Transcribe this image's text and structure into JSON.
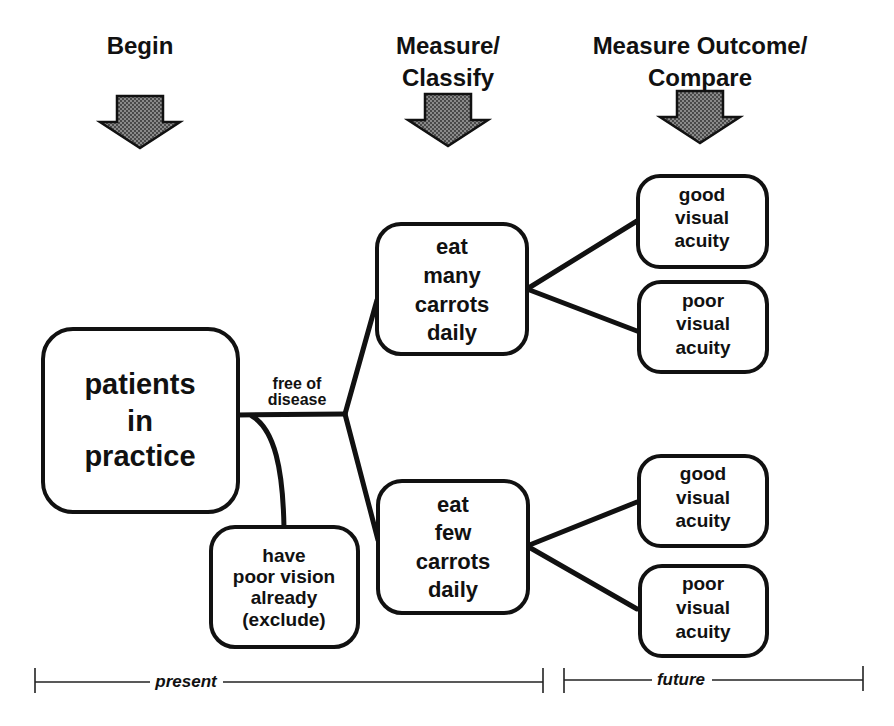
{
  "diagram": {
    "type": "flow",
    "stages": [
      {
        "id": "begin",
        "label_lines": [
          "Begin"
        ]
      },
      {
        "id": "measure_classify",
        "label_lines": [
          "Measure/",
          "Classify"
        ]
      },
      {
        "id": "measure_outcome",
        "label_lines": [
          "Measure Outcome/",
          "Compare"
        ]
      }
    ],
    "nodes": {
      "patients": {
        "lines": [
          "patients",
          "in",
          "practice"
        ]
      },
      "exclude": {
        "lines": [
          "have",
          "poor vision",
          "already",
          "(exclude)"
        ]
      },
      "many": {
        "lines": [
          "eat",
          "many",
          "carrots",
          "daily"
        ]
      },
      "few": {
        "lines": [
          "eat",
          "few",
          "carrots",
          "daily"
        ]
      },
      "many_good": {
        "lines": [
          "good",
          "visual",
          "acuity"
        ]
      },
      "many_poor": {
        "lines": [
          "poor",
          "visual",
          "acuity"
        ]
      },
      "few_good": {
        "lines": [
          "good",
          "visual",
          "acuity"
        ]
      },
      "few_poor": {
        "lines": [
          "poor",
          "visual",
          "acuity"
        ]
      }
    },
    "edges": [
      {
        "from": "patients",
        "to": "many",
        "label_lines": [
          "free of",
          "disease"
        ]
      },
      {
        "from": "patients",
        "to": "few",
        "label_lines": [
          "free of",
          "disease"
        ]
      },
      {
        "from": "patients",
        "to": "exclude"
      },
      {
        "from": "many",
        "to": "many_good"
      },
      {
        "from": "many",
        "to": "many_poor"
      },
      {
        "from": "few",
        "to": "few_good"
      },
      {
        "from": "few",
        "to": "few_poor"
      }
    ],
    "timeline": {
      "present_label": "present",
      "future_label": "future"
    },
    "colors": {
      "ink": "#111111",
      "background": "#ffffff",
      "arrow_fill": "#6e6e6e"
    }
  }
}
